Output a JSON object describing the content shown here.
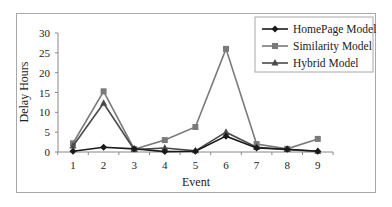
{
  "chart_data": {
    "type": "line",
    "title": "",
    "xlabel": "Event",
    "ylabel": "Delay Hours",
    "categories": [
      "1",
      "2",
      "3",
      "4",
      "5",
      "6",
      "7",
      "8",
      "9"
    ],
    "x": [
      1,
      2,
      3,
      4,
      5,
      6,
      7,
      8,
      9
    ],
    "ylim": [
      0,
      30
    ],
    "yticks": [
      "0",
      "5",
      "10",
      "15",
      "20",
      "25",
      "30"
    ],
    "grid": false,
    "legend_position": "upper right",
    "series": [
      {
        "name": "HomePage Model",
        "marker": "diamond",
        "color": "#1a1a1a",
        "values": [
          0.2,
          1.2,
          0.8,
          0.1,
          0.2,
          4.0,
          1.0,
          0.7,
          0.2
        ]
      },
      {
        "name": "Similarity Model",
        "marker": "square",
        "color": "#7a7a7a",
        "values": [
          2.2,
          15.3,
          0.7,
          3.0,
          6.3,
          26.0,
          2.0,
          0.8,
          3.3
        ]
      },
      {
        "name": "Hybrid Model",
        "marker": "triangle",
        "color": "#4a4a4a",
        "values": [
          1.5,
          12.3,
          0.6,
          1.0,
          0.3,
          5.0,
          1.2,
          0.6,
          0.2
        ]
      }
    ]
  },
  "legend": {
    "items": [
      "HomePage Model",
      "Similarity Model",
      "Hybrid Model"
    ]
  },
  "axes": {
    "x_title": "Event",
    "y_title": "Delay Hours"
  }
}
